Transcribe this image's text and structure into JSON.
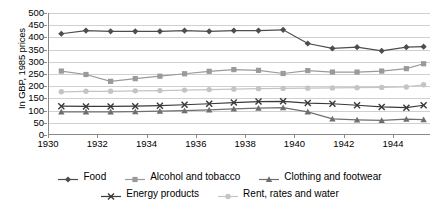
{
  "chart_data": {
    "type": "line",
    "title": "",
    "xlabel": "",
    "ylabel": "In GBP, 1985 prices",
    "xlim": [
      1930,
      1945.5
    ],
    "ylim": [
      0,
      500
    ],
    "grid": true,
    "legend_position": "bottom",
    "xticks": [
      "1930",
      "1932",
      "1934",
      "1936",
      "1938",
      "1940",
      "1942",
      "1944"
    ],
    "xtick_values": [
      1930,
      1932,
      1934,
      1936,
      1938,
      1940,
      1942,
      1944
    ],
    "yticks": [
      "0",
      "50",
      "100",
      "150",
      "200",
      "250",
      "300",
      "350",
      "400",
      "450",
      "500"
    ],
    "ytick_values": [
      0,
      50,
      100,
      150,
      200,
      250,
      300,
      350,
      400,
      450,
      500
    ],
    "x": [
      1930.5,
      1931.5,
      1932.5,
      1933.5,
      1934.5,
      1935.5,
      1936.5,
      1937.5,
      1938.5,
      1939.5,
      1940.5,
      1941.5,
      1942.5,
      1943.5,
      1944.5,
      1945.2
    ],
    "series": [
      {
        "name": "Food",
        "color": "#4d4d4d",
        "marker": "diamond",
        "values": [
          415,
          428,
          425,
          425,
          425,
          428,
          425,
          428,
          428,
          431,
          375,
          355,
          360,
          345,
          360,
          362
        ]
      },
      {
        "name": "Alcohol and tobacco",
        "color": "#9a9a9a",
        "marker": "square",
        "values": [
          262,
          248,
          220,
          231,
          241,
          251,
          261,
          268,
          265,
          252,
          264,
          258,
          258,
          262,
          272,
          292
        ]
      },
      {
        "name": "Clothing and footwear",
        "color": "#6f6f6f",
        "marker": "triangle",
        "values": [
          95,
          95,
          95,
          96,
          98,
          100,
          103,
          107,
          110,
          112,
          95,
          66,
          62,
          60,
          65,
          63
        ]
      },
      {
        "name": "Energy products",
        "color": "#3a3a3a",
        "marker": "cross",
        "values": [
          118,
          117,
          117,
          118,
          120,
          124,
          128,
          133,
          137,
          138,
          131,
          128,
          122,
          115,
          112,
          122
        ]
      },
      {
        "name": "Rent, rates and water",
        "color": "#c4c4c4",
        "marker": "circle",
        "values": [
          177,
          179,
          179,
          181,
          182,
          184,
          186,
          188,
          190,
          191,
          192,
          193,
          194,
          195,
          197,
          206
        ]
      }
    ]
  }
}
